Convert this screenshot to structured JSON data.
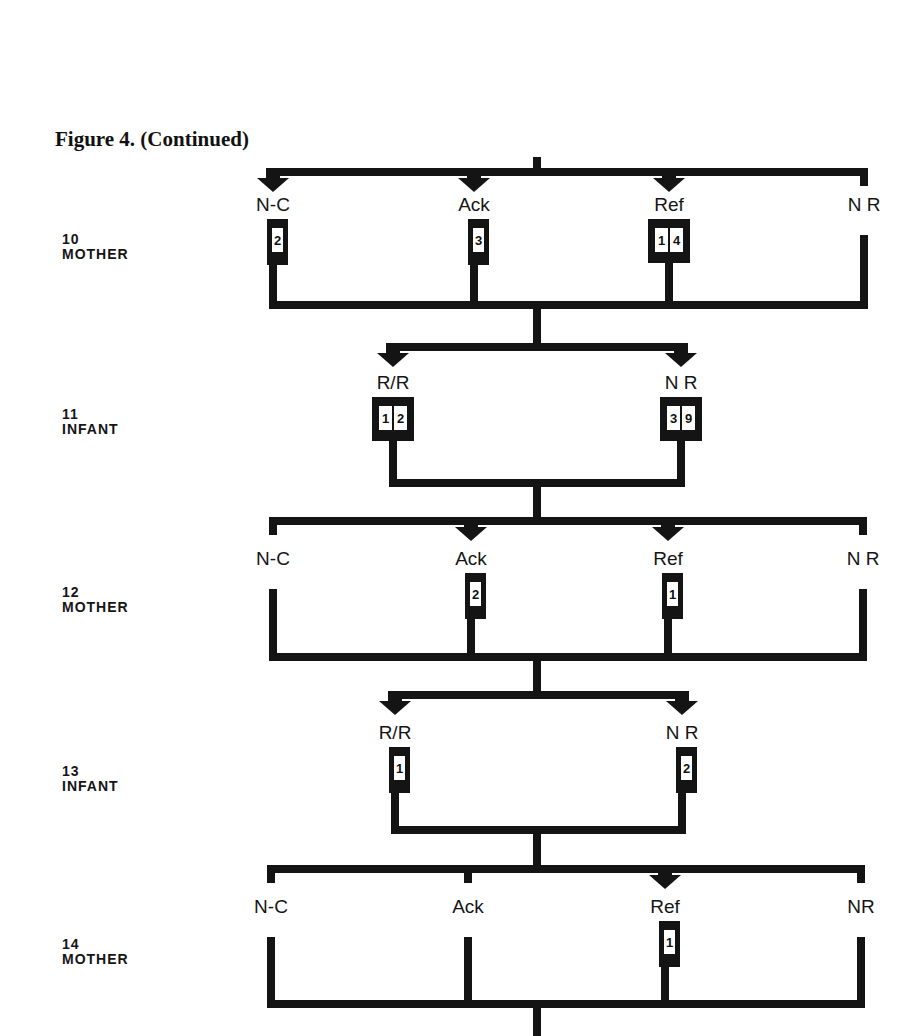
{
  "figure": {
    "title": "Figure 4. (Continued)"
  },
  "colors": {
    "ink": "#141414",
    "paper": "#ffffff"
  },
  "rows": [
    {
      "step": "10",
      "actor": "MOTHER",
      "label_top": 232,
      "bar_top_y": 168,
      "bar_bottom_y": 301,
      "label_y": 205,
      "stem_top_from": 157,
      "options": [
        {
          "label": "N-C",
          "x": 273,
          "arrow": true,
          "count": "2",
          "box": "narrow"
        },
        {
          "label": "Ack",
          "x": 474,
          "arrow": true,
          "count": "3",
          "box": "narrow"
        },
        {
          "label": "Ref",
          "x": 669,
          "arrow": true,
          "count": "14",
          "box": "wide"
        },
        {
          "label": "N R",
          "x": 864,
          "arrow": false,
          "count": "",
          "box": "none"
        }
      ]
    },
    {
      "step": "11",
      "actor": "INFANT",
      "label_top": 407,
      "bar_top_y": 343,
      "bar_bottom_y": 479,
      "label_y": 383,
      "options": [
        {
          "label": "R/R",
          "x": 393,
          "arrow": true,
          "count": "12",
          "box": "wide"
        },
        {
          "label": "N R",
          "x": 681,
          "arrow": true,
          "count": "39",
          "box": "wide"
        }
      ]
    },
    {
      "step": "12",
      "actor": "MOTHER",
      "label_top": 585,
      "bar_top_y": 517,
      "bar_bottom_y": 653,
      "label_y": 559,
      "options": [
        {
          "label": "N-C",
          "x": 273,
          "arrow": false,
          "count": "",
          "box": "none"
        },
        {
          "label": "Ack",
          "x": 471,
          "arrow": true,
          "count": "2",
          "box": "narrow"
        },
        {
          "label": "Ref",
          "x": 668,
          "arrow": true,
          "count": "1",
          "box": "narrow"
        },
        {
          "label": "N R",
          "x": 863,
          "arrow": false,
          "count": "",
          "box": "none"
        }
      ]
    },
    {
      "step": "13",
      "actor": "INFANT",
      "label_top": 764,
      "bar_top_y": 691,
      "bar_bottom_y": 826,
      "label_y": 733,
      "options": [
        {
          "label": "R/R",
          "x": 395,
          "arrow": true,
          "count": "1",
          "box": "narrow"
        },
        {
          "label": "N R",
          "x": 682,
          "arrow": true,
          "count": "2",
          "box": "narrow"
        }
      ]
    },
    {
      "step": "14",
      "actor": "MOTHER",
      "label_top": 937,
      "bar_top_y": 865,
      "bar_bottom_y": 1000,
      "label_y": 907,
      "options": [
        {
          "label": "N-C",
          "x": 271,
          "arrow": false,
          "count": "",
          "box": "none"
        },
        {
          "label": "Ack",
          "x": 468,
          "arrow": false,
          "count": "",
          "box": "none"
        },
        {
          "label": "Ref",
          "x": 665,
          "arrow": true,
          "count": "1",
          "box": "narrow"
        },
        {
          "label": "NR",
          "x": 861,
          "arrow": false,
          "count": "",
          "box": "none"
        }
      ]
    }
  ],
  "trunk_x": 537,
  "bottom_stem_end_y": 1036
}
